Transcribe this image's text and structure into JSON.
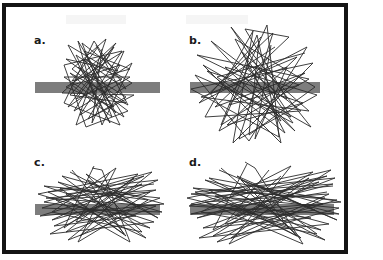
{
  "figure": {
    "background_color": "#ffffff",
    "frame_color": "#141414",
    "bar_color": "#7d7d7d",
    "stroke_color": "#2b2b2b",
    "panel_count": 4
  },
  "panels": [
    {
      "id": "a",
      "label": "a.",
      "description": "tall narrow dense straight-line scribble centered on a horizontal grey bar",
      "bar": {
        "x": 31,
        "y": 78,
        "width": 125,
        "height": 11
      },
      "extent": {
        "x": 56,
        "y": 38,
        "width": 78,
        "height": 84
      }
    },
    {
      "id": "b",
      "label": "b.",
      "description": "large spread star-like straight-line scribble crossing a horizontal grey bar",
      "bar": {
        "x": 186,
        "y": 78,
        "width": 130,
        "height": 11
      },
      "extent": {
        "x": 196,
        "y": 25,
        "width": 120,
        "height": 115
      }
    },
    {
      "id": "c",
      "label": "c.",
      "description": "wide flat straight-line scribble lying across a horizontal grey bar",
      "bar": {
        "x": 31,
        "y": 200,
        "width": 125,
        "height": 11
      },
      "extent": {
        "x": 40,
        "y": 168,
        "width": 122,
        "height": 78
      }
    },
    {
      "id": "d",
      "label": "d.",
      "description": "widest flattest straight-line scribble spanning a long horizontal grey bar",
      "bar": {
        "x": 186,
        "y": 200,
        "width": 144,
        "height": 11
      },
      "extent": {
        "x": 190,
        "y": 168,
        "width": 145,
        "height": 78
      }
    }
  ],
  "labels": {
    "a": "a.",
    "b": "b.",
    "c": "c.",
    "d": "d."
  }
}
